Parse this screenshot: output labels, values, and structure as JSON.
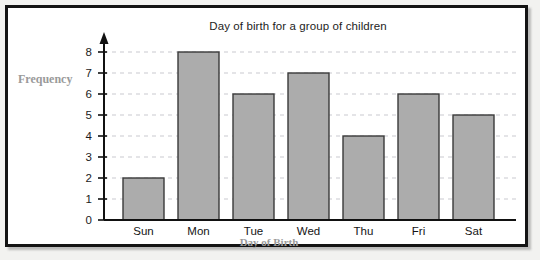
{
  "chart_data": {
    "type": "bar",
    "title": "Day of birth for a group of children",
    "xlabel": "Day of Birth",
    "ylabel": "Frequency",
    "categories": [
      "Sun",
      "Mon",
      "Tue",
      "Wed",
      "Thu",
      "Fri",
      "Sat"
    ],
    "values": [
      2,
      8,
      6,
      7,
      4,
      6,
      5
    ],
    "yticks": [
      "0",
      "1",
      "2",
      "3",
      "4",
      "5",
      "6",
      "7",
      "8"
    ],
    "ylim": [
      0,
      8
    ],
    "grid": true,
    "legend": "none",
    "bar_color": "#acacac",
    "bar_edge_color": "#3a3a3a",
    "grid_color": "#c9c9cf",
    "axis_color": "#111111",
    "label_color": "#9a9a9a",
    "title_color": "#1d1d1d"
  }
}
